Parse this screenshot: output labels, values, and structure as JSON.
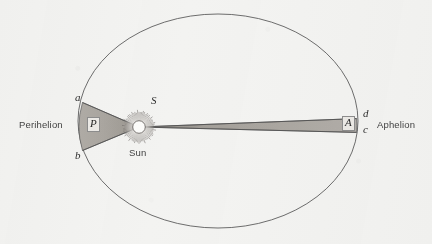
{
  "figure": {
    "background_color": "#f3f3f1",
    "ink_color": "#4a4a4a",
    "sector_fill_color": "#a8a49e",
    "width": 432,
    "height": 244
  },
  "orbit": {
    "name": "planet-orbit-ellipse",
    "center_x": 218,
    "center_y": 121,
    "radius_x": 140,
    "radius_y": 107,
    "stroke": "#5a5a5a",
    "stroke_width": 0.9
  },
  "sun": {
    "label": "Sun",
    "point_label": "S",
    "center_x": 139,
    "center_y": 127,
    "disc_radius": 6.2,
    "corona_radius": 17,
    "disc_color": "#fdfdfb",
    "ray_count": 68
  },
  "labels": {
    "perihelion": "Perihelion",
    "aphelion": "Aphelion",
    "sun_name": "Sun",
    "sun_point": "S",
    "point_a": "a",
    "point_b": "b",
    "point_c": "c",
    "point_d": "d",
    "area_near": "P",
    "area_far": "A"
  },
  "sectors": [
    {
      "name": "perihelion-sector",
      "area_label": "P",
      "vertices": [
        {
          "label": "S",
          "x": 139,
          "y": 127
        },
        {
          "label": "a",
          "x": 82,
          "y": 103
        },
        {
          "label": "b",
          "x": 82,
          "y": 150
        }
      ],
      "fill": "#a8a49e"
    },
    {
      "name": "aphelion-sector",
      "area_label": "A",
      "vertices": [
        {
          "label": "S",
          "x": 139,
          "y": 127
        },
        {
          "label": "d",
          "x": 357,
          "y": 119
        },
        {
          "label": "c",
          "x": 357,
          "y": 132
        }
      ],
      "fill": "#a8a49e"
    }
  ],
  "chart_data": {
    "type": "diagram",
    "annotations": [
      {
        "text": "Perihelion",
        "x": 20,
        "y": 125,
        "style": "sans"
      },
      {
        "text": "Aphelion",
        "x": 377,
        "y": 125,
        "style": "sans"
      },
      {
        "text": "Sun",
        "x": 130,
        "y": 153,
        "style": "sans"
      },
      {
        "text": "S",
        "x": 152,
        "y": 100,
        "style": "serif-italic"
      },
      {
        "text": "a",
        "x": 76,
        "y": 97,
        "style": "serif-italic"
      },
      {
        "text": "b",
        "x": 76,
        "y": 155,
        "style": "serif-italic"
      },
      {
        "text": "d",
        "x": 363,
        "y": 113,
        "style": "serif-italic"
      },
      {
        "text": "c",
        "x": 363,
        "y": 129,
        "style": "serif-italic"
      },
      {
        "text": "P",
        "x": 89,
        "y": 120,
        "style": "boxed-serif-italic"
      },
      {
        "text": "A",
        "x": 344,
        "y": 118,
        "style": "boxed-serif-italic"
      }
    ]
  }
}
